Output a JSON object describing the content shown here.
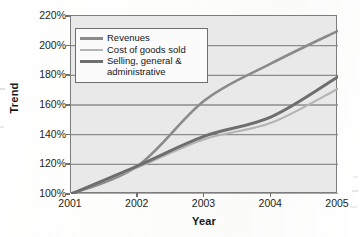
{
  "chart_data": {
    "type": "line",
    "title": "",
    "xlabel": "Year",
    "ylabel": "Trend",
    "x": [
      "2001",
      "2002",
      "2003",
      "2004",
      "2005"
    ],
    "categories": [
      "2001",
      "2002",
      "2003",
      "2004",
      "2005"
    ],
    "xlim": [
      2001,
      2005
    ],
    "ylim": [
      100,
      220
    ],
    "y_tick_labels": [
      "220%",
      "200%",
      "180%",
      "160%",
      "140%",
      "120%",
      "100%"
    ],
    "y_tick_values": [
      220,
      200,
      180,
      160,
      140,
      120,
      100
    ],
    "y_tick_step": 20,
    "y_unit": "%",
    "grid": "horizontal",
    "legend_position": "upper-left-inside",
    "series": [
      {
        "name": "Revenues",
        "color": "#8a8a8a",
        "values": [
          100,
          119,
          163,
          188,
          210
        ]
      },
      {
        "name": "Cost of goods sold",
        "color": "#b4b4b4",
        "values": [
          100,
          118,
          137,
          148,
          171
        ]
      },
      {
        "name": "Selling, general &\nadministrative",
        "color": "#6e6e6e",
        "values": [
          100,
          119,
          139,
          152,
          179
        ]
      }
    ]
  },
  "axes": {
    "y_title": "Trend",
    "x_title": "Year"
  },
  "legend": {
    "items": [
      {
        "label": "Revenues"
      },
      {
        "label": "Cost of goods sold"
      },
      {
        "label": "Selling, general &\nadministrative"
      }
    ]
  },
  "colors": {
    "plot_background": "#e9e9e9",
    "plot_border": "#7d7d7d",
    "gridline": "#8c8c8c",
    "page_background": "#ffffff",
    "text": "#17181a"
  }
}
